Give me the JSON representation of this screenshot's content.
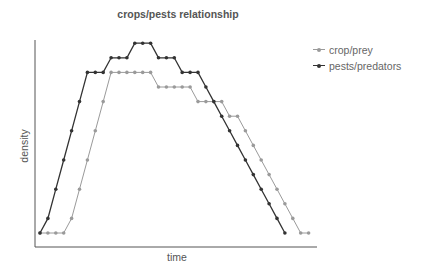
{
  "chart_data": {
    "type": "line",
    "title": "crops/pests relationship",
    "xlabel": "time",
    "ylabel": "density",
    "grid": false,
    "legend_position": "upper right, outside plot",
    "ylim": [
      0,
      14
    ],
    "series": [
      {
        "name": "crop/prey",
        "color": "#9a9a9a",
        "x": [
          0,
          1,
          2,
          3,
          4,
          5,
          6,
          7,
          8,
          9,
          10,
          11,
          12,
          13,
          14,
          15,
          16,
          17,
          18,
          19,
          20,
          21,
          22,
          23,
          24,
          25,
          26,
          27,
          28,
          29,
          30,
          31,
          32,
          33,
          34
        ],
        "values": [
          0,
          0,
          0,
          0,
          1,
          3,
          5,
          7,
          9,
          11,
          11,
          11,
          11,
          11,
          11,
          10,
          10,
          10,
          10,
          10,
          9,
          9,
          9,
          9,
          8,
          8,
          7,
          6,
          5,
          4,
          3,
          2,
          1,
          0,
          0
        ]
      },
      {
        "name": "pests/predators",
        "color": "#333333",
        "x": [
          0,
          1,
          2,
          3,
          4,
          5,
          6,
          7,
          8,
          9,
          10,
          11,
          12,
          13,
          14,
          15,
          16,
          17,
          18,
          19,
          20,
          21,
          22,
          23,
          24,
          25,
          26,
          27,
          28,
          29,
          30,
          31
        ],
        "values": [
          0,
          1,
          3,
          5,
          7,
          9,
          11,
          11,
          11,
          12,
          12,
          12,
          13,
          13,
          13,
          12,
          12,
          12,
          11,
          11,
          11,
          10,
          9,
          8,
          7,
          6,
          5,
          4,
          3,
          2,
          1,
          0
        ]
      }
    ]
  },
  "labels": {
    "title": "crops/pests relationship",
    "xlabel": "time",
    "ylabel": "density",
    "legend": [
      "crop/prey",
      "pests/predators"
    ]
  }
}
